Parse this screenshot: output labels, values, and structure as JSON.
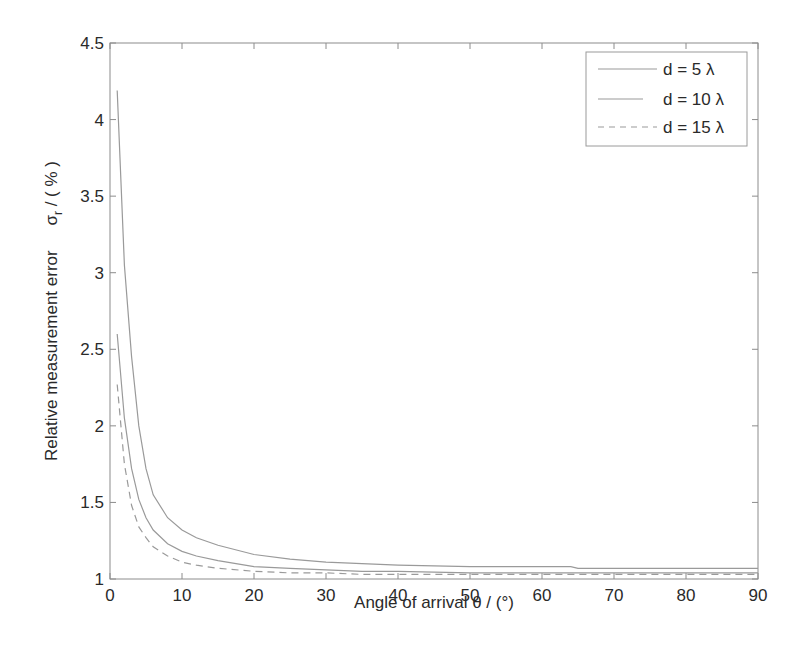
{
  "chart_data": {
    "type": "line",
    "title": "",
    "xlabel": "Angle of arrival    θ / (°)",
    "ylabel": "Relative measurement error    σ_r / ( % )",
    "ylabel_main": "Relative measurement error",
    "ylabel_symbol": "σ",
    "ylabel_subscript": "r",
    "ylabel_unit": " / ( % )",
    "xlim": [
      0,
      90
    ],
    "ylim": [
      1,
      4.5
    ],
    "xticks": [
      0,
      10,
      20,
      30,
      40,
      50,
      60,
      70,
      80,
      90
    ],
    "yticks": [
      1,
      1.5,
      2,
      2.5,
      3,
      3.5,
      4,
      4.5
    ],
    "xtick_labels": [
      "0",
      "10",
      "20",
      "30",
      "40",
      "50",
      "60",
      "70",
      "80",
      "90"
    ],
    "ytick_labels": [
      "1",
      "1.5",
      "2",
      "2.5",
      "3",
      "3.5",
      "4",
      "4.5"
    ],
    "grid": false,
    "legend_position": "upper right",
    "x": [
      1,
      2,
      3,
      4,
      5,
      6,
      8,
      10,
      12,
      15,
      20,
      25,
      30,
      35,
      40,
      50,
      60,
      64,
      65,
      70,
      80,
      90
    ],
    "series": [
      {
        "name": "d = 5 λ",
        "style": "solid",
        "values": [
          4.19,
          3.05,
          2.45,
          2.0,
          1.72,
          1.55,
          1.4,
          1.32,
          1.27,
          1.22,
          1.16,
          1.13,
          1.11,
          1.1,
          1.09,
          1.08,
          1.08,
          1.08,
          1.07,
          1.07,
          1.07,
          1.07
        ]
      },
      {
        "name": "d = 10 λ",
        "style": "solid",
        "values": [
          2.6,
          2.05,
          1.72,
          1.52,
          1.4,
          1.32,
          1.23,
          1.18,
          1.15,
          1.12,
          1.08,
          1.07,
          1.06,
          1.05,
          1.05,
          1.04,
          1.04,
          1.04,
          1.04,
          1.04,
          1.04,
          1.04
        ]
      },
      {
        "name": "d = 15 λ",
        "style": "dashed",
        "values": [
          2.27,
          1.75,
          1.48,
          1.34,
          1.27,
          1.21,
          1.15,
          1.11,
          1.09,
          1.07,
          1.05,
          1.04,
          1.04,
          1.03,
          1.03,
          1.03,
          1.03,
          1.03,
          1.03,
          1.03,
          1.03,
          1.03
        ]
      }
    ]
  },
  "colors": {
    "line": "#9a9a9a",
    "axis": "#8c8c8c",
    "text": "#2a2a2a"
  }
}
